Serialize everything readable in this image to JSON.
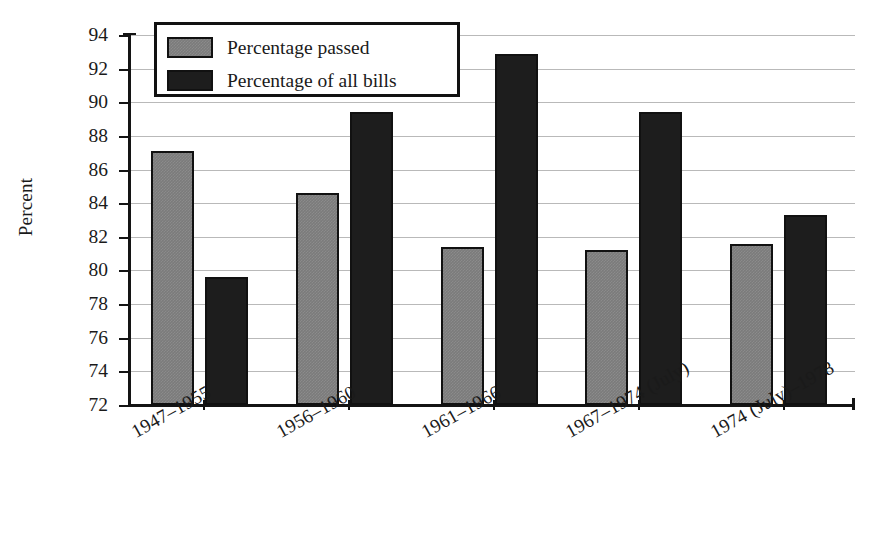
{
  "chart_data": {
    "type": "bar",
    "title": "",
    "xlabel": "",
    "ylabel": "Percent",
    "ylim": [
      72,
      94
    ],
    "yticks": [
      72,
      74,
      76,
      78,
      80,
      82,
      84,
      86,
      88,
      90,
      92,
      94
    ],
    "grid": true,
    "legend_position": "upper-left-inside",
    "categories": [
      "1947–1955",
      "1956–1960",
      "1961–1966",
      "1967–1974 (July)",
      "1974 (July)–1978"
    ],
    "series": [
      {
        "name": "Percentage passed",
        "color": "#7b7b7b",
        "values": [
          87.1,
          84.6,
          81.4,
          81.2,
          81.6
        ]
      },
      {
        "name": "Percentage of all bills",
        "color": "#1d1d1d",
        "values": [
          79.6,
          89.4,
          92.9,
          89.4,
          83.3
        ]
      }
    ]
  },
  "legend": {
    "items": [
      {
        "label": "Percentage passed",
        "swatch": "gray"
      },
      {
        "label": "Percentage of all bills",
        "swatch": "black"
      }
    ]
  },
  "axes": {
    "y_title": "Percent"
  }
}
